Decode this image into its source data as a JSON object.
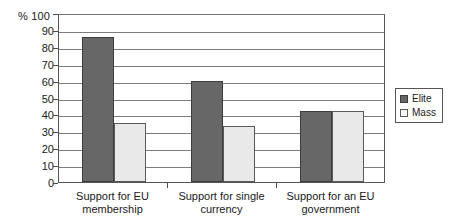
{
  "chart_data": {
    "type": "bar",
    "title": "",
    "subtitle": "",
    "xlabel": "",
    "ylabel": "%",
    "ylim": [
      0,
      100
    ],
    "y_ticks": [
      0,
      10,
      20,
      30,
      40,
      50,
      60,
      70,
      80,
      90,
      100
    ],
    "y_tick_labels": [
      "0",
      "10",
      "20",
      "30",
      "40",
      "50",
      "60",
      "70",
      "80",
      "90",
      "100"
    ],
    "y_axis_unit_label": "%",
    "y_axis_top_label": "% 100",
    "grid": true,
    "grid_axis": "y",
    "legend_position": "right",
    "categories": [
      "Support for EU\nmembership",
      "Support for single\ncurrency",
      "Support for an EU\ngovernment"
    ],
    "series": [
      {
        "name": "Elite",
        "color": "#676767",
        "values": [
          86,
          60,
          42
        ]
      },
      {
        "name": "Mass",
        "color": "#e9e9e9",
        "values": [
          35,
          33,
          42
        ]
      }
    ]
  },
  "legend": {
    "items": [
      {
        "label": "Elite",
        "swatch": "elite"
      },
      {
        "label": "Mass",
        "swatch": "mass"
      }
    ]
  }
}
